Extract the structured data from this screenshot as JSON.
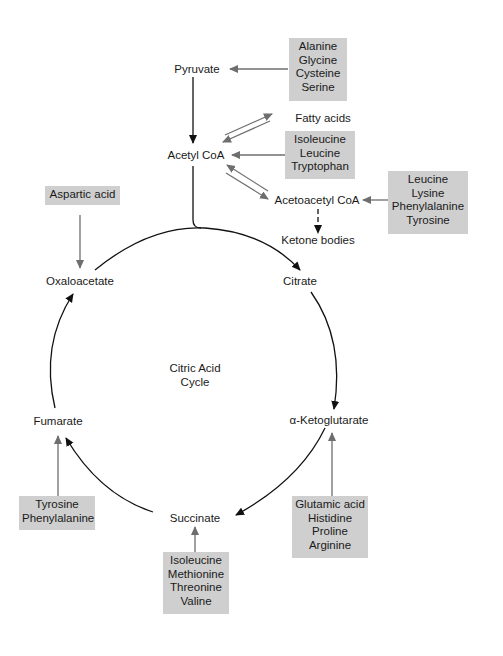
{
  "metabolites": {
    "pyruvate": "Pyruvate",
    "fatty_acids": "Fatty acids",
    "acetyl_coa": "Acetyl CoA",
    "acetoacetyl_coa": "Acetoacetyl CoA",
    "ketone_bodies": "Ketone bodies",
    "oxaloacetate": "Oxaloacetate",
    "citrate": "Citrate",
    "alpha_ketoglutarate": "α-Ketoglutarate",
    "succinate": "Succinate",
    "fumarate": "Fumarate"
  },
  "cycle_title": [
    "Citric Acid",
    "Cycle"
  ],
  "amino_acid_boxes": {
    "to_pyruvate": [
      "Alanine",
      "Glycine",
      "Cysteine",
      "Serine"
    ],
    "to_acetyl_coa": [
      "Isoleucine",
      "Leucine",
      "Tryptophan"
    ],
    "to_acetoacetyl_coa": [
      "Leucine",
      "Lysine",
      "Phenylalanine",
      "Tyrosine"
    ],
    "to_oxaloacetate": [
      "Aspartic acid"
    ],
    "to_alpha_ketoglutarate": [
      "Glutamic acid",
      "Histidine",
      "Proline",
      "Arginine"
    ],
    "to_succinate": [
      "Isoleucine",
      "Methionine",
      "Threonine",
      "Valine"
    ],
    "to_fumarate": [
      "Tyrosine",
      "Phenylalanine"
    ]
  },
  "colors": {
    "box_fill": "#cfcfcf",
    "box_shadow": "#555555",
    "arrow_black": "#111111",
    "arrow_gray": "#6e6e6e"
  }
}
